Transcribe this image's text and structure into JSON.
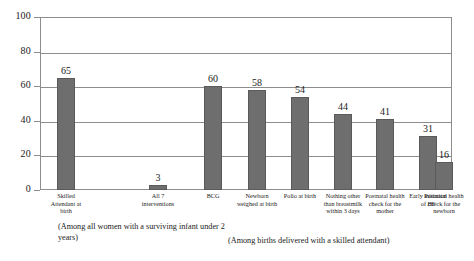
{
  "chart_data": {
    "type": "bar",
    "title": "",
    "xlabel": "",
    "ylabel": "",
    "ylim": [
      0,
      100
    ],
    "yticks": [
      0,
      20,
      40,
      60,
      80,
      100
    ],
    "grid": true,
    "legend": "none",
    "bar_color": "#6e6e6e",
    "categories": [
      "Skilled Attendant at birth",
      "All 7 interventions",
      "BCG",
      "Newborn weighed at birth",
      "Polio at birth",
      "Nothing other than breastmilk within 3 days",
      "Postnatal health check for the mother",
      "Early initiation of BF",
      "Postnatal health check for the newborn"
    ],
    "values": [
      65,
      3,
      60,
      58,
      54,
      44,
      41,
      31,
      16
    ],
    "annotations": [
      "(Among all women with a surviving infant under 2 years)",
      "(Among births delivered with a skilled attendant)"
    ]
  },
  "axis": {
    "tick_100": "100",
    "tick_80": "80",
    "tick_60": "60",
    "tick_40": "40",
    "tick_20": "20",
    "tick_0": "0"
  },
  "captions": {
    "left": "(Among all women with a surviving infant under 2 years)",
    "right": "(Among births delivered with a skilled attendant)"
  }
}
